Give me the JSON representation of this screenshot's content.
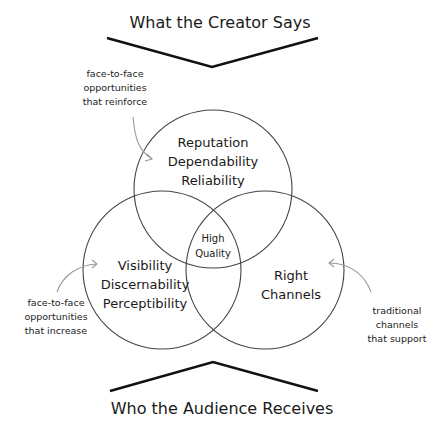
{
  "header": {
    "title": "What the Creator Says"
  },
  "footer": {
    "title": "Who the Audience Receives"
  },
  "circles": {
    "top": {
      "lines": [
        "Reputation",
        "Dependability",
        "Reliability"
      ]
    },
    "left": {
      "lines": [
        "Visibility",
        "Discernability",
        "Perceptibility"
      ]
    },
    "right": {
      "lines": [
        "Right",
        "Channels"
      ]
    },
    "center": {
      "lines": [
        "High",
        "Quality"
      ]
    }
  },
  "annotations": {
    "top_left": {
      "lines": [
        "face-to-face",
        "opportunities",
        "that reinforce"
      ]
    },
    "bottom_left": {
      "lines": [
        "face-to-face",
        "opportunities",
        "that increase"
      ]
    },
    "bottom_right": {
      "lines": [
        "traditional",
        "channels",
        "that support"
      ]
    }
  },
  "colors": {
    "stroke": "#444444",
    "text": "#1a1a1a",
    "arrow": "#999999"
  }
}
